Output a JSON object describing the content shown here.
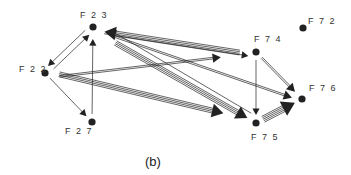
{
  "caption": "(b)",
  "colors": {
    "ink": "#222222",
    "background": "#ffffff"
  },
  "nodes": [
    {
      "id": "F23",
      "label": "F 2 3"
    },
    {
      "id": "F22",
      "label": "F 2 2"
    },
    {
      "id": "F27",
      "label": "F 2 7"
    },
    {
      "id": "F74",
      "label": "F 7 4"
    },
    {
      "id": "F72",
      "label": "F 7 2"
    },
    {
      "id": "F76",
      "label": "F 7 6"
    },
    {
      "id": "F75",
      "label": "F 7 5"
    }
  ],
  "edges": [
    {
      "from": "F22",
      "to": "F23",
      "strands": 1
    },
    {
      "from": "F23",
      "to": "F22",
      "strands": 1
    },
    {
      "from": "F22",
      "to": "F27",
      "strands": 1
    },
    {
      "from": "F27",
      "to": "F23",
      "strands": 1
    },
    {
      "from": "F74",
      "to": "F23",
      "strands": 4
    },
    {
      "from": "F23",
      "to": "F74",
      "strands": 1
    },
    {
      "from": "F22",
      "to": "F74",
      "strands": 2
    },
    {
      "from": "F23",
      "to": "F75",
      "strands": 4
    },
    {
      "from": "F75",
      "to": "F23",
      "strands": 1
    },
    {
      "from": "F22",
      "to": "F75",
      "strands": 4
    },
    {
      "from": "F23",
      "to": "F76",
      "strands": 2
    },
    {
      "from": "F74",
      "to": "F76",
      "strands": 2
    },
    {
      "from": "F74",
      "to": "F75",
      "strands": 1
    },
    {
      "from": "F75",
      "to": "F76",
      "strands": 5
    }
  ]
}
